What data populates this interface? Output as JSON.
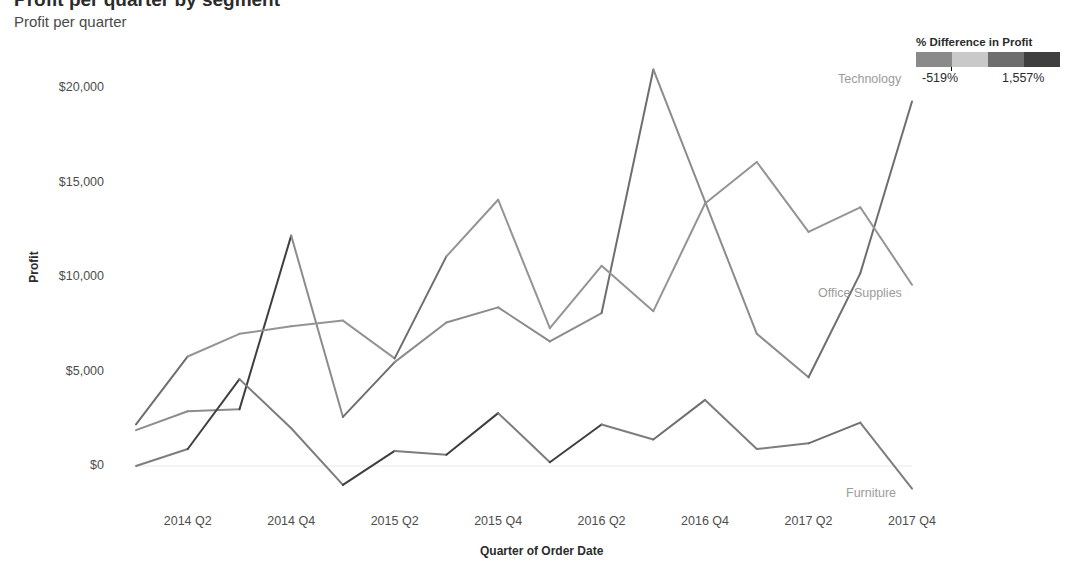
{
  "header": {
    "title": "Profit per quarter by segment",
    "subtitle": "Profit per quarter"
  },
  "legend": {
    "title": "% Difference in Profit",
    "min_label": "-519%",
    "max_label": "1,557%",
    "swatches": [
      "#8a8a8a",
      "#c9c9c9",
      "#6e6e6e",
      "#3f3f3f"
    ]
  },
  "axes": {
    "y_title": "Profit",
    "x_title": "Quarter of Order Date",
    "y_ticks": [
      "$0",
      "$5,000",
      "$10,000",
      "$15,000",
      "$20,000"
    ],
    "x_ticks": [
      "2014 Q2",
      "2014 Q4",
      "2015 Q2",
      "2015 Q4",
      "2016 Q2",
      "2016 Q4",
      "2017 Q2",
      "2017 Q4"
    ]
  },
  "series_labels": {
    "technology": "Technology",
    "office_supplies": "Office Supplies",
    "furniture": "Furniture"
  },
  "chart_data": {
    "type": "line",
    "title": "Profit per quarter by segment",
    "subtitle": "Profit per quarter",
    "xlabel": "Quarter of Order Date",
    "ylabel": "Profit",
    "ylim": [
      0,
      21500
    ],
    "grid": false,
    "legend_position": "top-right",
    "legend_title": "% Difference in Profit",
    "color_scale": {
      "min": -519,
      "max": 1557,
      "min_label": "-519%",
      "max_label": "1,557%",
      "unit": "%"
    },
    "x": [
      "2014 Q1",
      "2014 Q2",
      "2014 Q3",
      "2014 Q4",
      "2015 Q1",
      "2015 Q2",
      "2015 Q3",
      "2015 Q4",
      "2016 Q1",
      "2016 Q2",
      "2016 Q3",
      "2016 Q4",
      "2017 Q1",
      "2017 Q2",
      "2017 Q3",
      "2017 Q4"
    ],
    "series": [
      {
        "name": "Technology",
        "values": [
          1900,
          2900,
          3000,
          12200,
          2600,
          5500,
          7600,
          8400,
          6600,
          8100,
          21000,
          14000,
          7000,
          4700,
          10200,
          19300
        ]
      },
      {
        "name": "Office Supplies",
        "values": [
          2200,
          5800,
          7000,
          7400,
          7700,
          5700,
          11100,
          14100,
          7300,
          10600,
          8200,
          13900,
          16100,
          12400,
          13700,
          9600
        ]
      },
      {
        "name": "Furniture",
        "values": [
          0,
          900,
          4600,
          2000,
          -1000,
          800,
          600,
          2800,
          200,
          2200,
          1400,
          3500,
          900,
          1200,
          2300,
          -1200
        ]
      }
    ]
  }
}
